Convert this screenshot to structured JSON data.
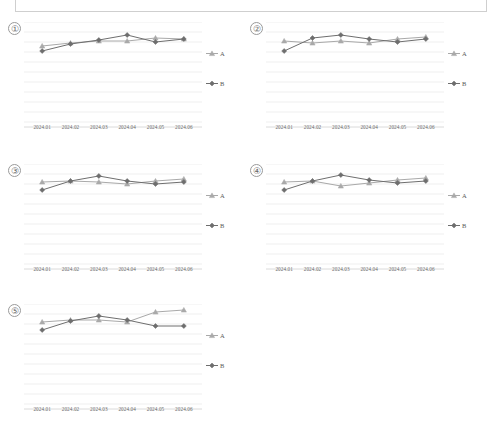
{
  "page": {
    "top_box": "",
    "series_colors": {
      "A": "#a9a9a9",
      "B": "#6e6e6e",
      "grid": "#e8e8e8",
      "axis": "#d6d6d6"
    },
    "legend": {
      "a_label": "A",
      "b_label": "B",
      "a_marker": "triangle-marker",
      "b_marker": "diamond-marker"
    },
    "categories": [
      "2024.01",
      "2024.02",
      "2024.03",
      "2024.04",
      "2024.05",
      "2024.06"
    ]
  },
  "panels": [
    {
      "num": "①",
      "name": "chart-1"
    },
    {
      "num": "②",
      "name": "chart-2"
    },
    {
      "num": "③",
      "name": "chart-3"
    },
    {
      "num": "④",
      "name": "chart-4"
    },
    {
      "num": "⑤",
      "name": "chart-5"
    }
  ],
  "chart_data": [
    {
      "type": "line",
      "id": "chart-1",
      "title": "①",
      "xlabel": "",
      "ylabel": "",
      "categories": [
        "2024.01",
        "2024.02",
        "2024.03",
        "2024.04",
        "2024.05",
        "2024.06"
      ],
      "ylim": [
        0,
        10
      ],
      "grid": true,
      "legend": "right",
      "series": [
        {
          "name": "A",
          "marker": "triangle",
          "color": "#a9a9a9",
          "values": [
            7.6,
            7.9,
            8.1,
            8.1,
            8.4,
            8.3
          ]
        },
        {
          "name": "B",
          "marker": "diamond",
          "color": "#6e6e6e",
          "values": [
            7.1,
            7.8,
            8.2,
            8.7,
            8.0,
            8.3
          ]
        }
      ]
    },
    {
      "type": "line",
      "id": "chart-2",
      "title": "②",
      "xlabel": "",
      "ylabel": "",
      "categories": [
        "2024.01",
        "2024.02",
        "2024.03",
        "2024.04",
        "2024.05",
        "2024.06"
      ],
      "ylim": [
        0,
        10
      ],
      "grid": true,
      "legend": "right",
      "series": [
        {
          "name": "A",
          "marker": "triangle",
          "color": "#a9a9a9",
          "values": [
            8.1,
            7.9,
            8.1,
            7.9,
            8.3,
            8.5
          ]
        },
        {
          "name": "B",
          "marker": "diamond",
          "color": "#6e6e6e",
          "values": [
            7.1,
            8.4,
            8.7,
            8.3,
            8.0,
            8.3
          ]
        }
      ]
    },
    {
      "type": "line",
      "id": "chart-3",
      "title": "③",
      "xlabel": "",
      "ylabel": "",
      "categories": [
        "2024.01",
        "2024.02",
        "2024.03",
        "2024.04",
        "2024.05",
        "2024.06"
      ],
      "ylim": [
        0,
        10
      ],
      "grid": true,
      "legend": "right",
      "series": [
        {
          "name": "A",
          "marker": "triangle",
          "color": "#a9a9a9",
          "values": [
            8.2,
            8.3,
            8.2,
            8.0,
            8.3,
            8.5
          ]
        },
        {
          "name": "B",
          "marker": "diamond",
          "color": "#6e6e6e",
          "values": [
            7.4,
            8.3,
            8.8,
            8.3,
            8.0,
            8.2
          ]
        }
      ]
    },
    {
      "type": "line",
      "id": "chart-4",
      "title": "④",
      "xlabel": "",
      "ylabel": "",
      "categories": [
        "2024.01",
        "2024.02",
        "2024.03",
        "2024.04",
        "2024.05",
        "2024.06"
      ],
      "ylim": [
        0,
        10
      ],
      "grid": true,
      "legend": "right",
      "series": [
        {
          "name": "A",
          "marker": "triangle",
          "color": "#a9a9a9",
          "values": [
            8.2,
            8.3,
            7.8,
            8.1,
            8.4,
            8.6
          ]
        },
        {
          "name": "B",
          "marker": "diamond",
          "color": "#6e6e6e",
          "values": [
            7.4,
            8.3,
            8.9,
            8.4,
            8.1,
            8.3
          ]
        }
      ]
    },
    {
      "type": "line",
      "id": "chart-5",
      "title": "⑤",
      "xlabel": "",
      "ylabel": "",
      "categories": [
        "2024.01",
        "2024.02",
        "2024.03",
        "2024.04",
        "2024.05",
        "2024.06"
      ],
      "ylim": [
        0,
        10
      ],
      "grid": true,
      "legend": "right",
      "series": [
        {
          "name": "A",
          "marker": "triangle",
          "color": "#a9a9a9",
          "values": [
            8.2,
            8.4,
            8.4,
            8.2,
            9.2,
            9.4
          ]
        },
        {
          "name": "B",
          "marker": "diamond",
          "color": "#6e6e6e",
          "values": [
            7.4,
            8.3,
            8.8,
            8.4,
            7.8,
            7.8
          ]
        }
      ]
    }
  ]
}
